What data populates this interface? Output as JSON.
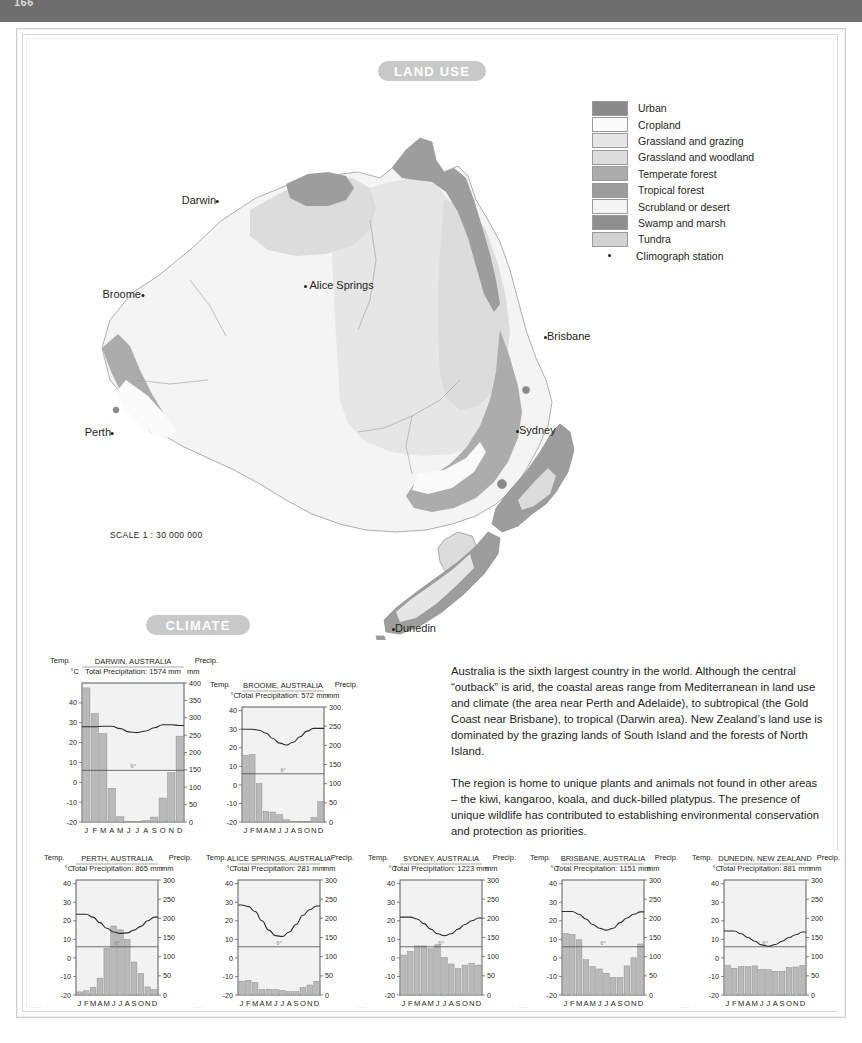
{
  "header": {
    "folio": "166"
  },
  "banners": {
    "land_use": "LAND USE",
    "climate": "CLIMATE"
  },
  "map": {
    "scale": "SCALE 1 : 30 000 000",
    "cities": [
      {
        "name": "Darwin",
        "x": 179,
        "y": 120,
        "align": "right"
      },
      {
        "name": "Broome",
        "x": 104,
        "y": 214,
        "align": "right"
      },
      {
        "name": "Alice Springs",
        "x": 308,
        "y": 276,
        "align": "left"
      },
      {
        "name": "Brisbane",
        "x": 551,
        "y": 325,
        "align": "left"
      },
      {
        "name": "Sydney",
        "x": 521,
        "y": 421,
        "align": "left"
      },
      {
        "name": "Perth",
        "x": 78,
        "y": 430,
        "align": "right"
      },
      {
        "name": "Dunedin",
        "x": 697,
        "y": 620,
        "align": "left"
      }
    ]
  },
  "legend": {
    "items": [
      {
        "label": "Urban",
        "color": "#8a8a8a"
      },
      {
        "label": "Cropland",
        "color": "#fbfbfb"
      },
      {
        "label": "Grassland and grazing",
        "color": "#e6e6e6"
      },
      {
        "label": "Grassland and woodland",
        "color": "#dcdcdc"
      },
      {
        "label": "Temperate forest",
        "color": "#acacac"
      },
      {
        "label": "Tropical forest",
        "color": "#9d9d9d"
      },
      {
        "label": "Scrubland or desert",
        "color": "#f4f4f4"
      },
      {
        "label": "Swamp and marsh",
        "color": "#8f8f8f"
      },
      {
        "label": "Tundra",
        "color": "#d2d2d2"
      }
    ],
    "station_label": "Climograph station"
  },
  "text": {
    "paragraph1": "Australia is the sixth largest country in the world. Although the central “outback” is arid, the coastal areas range from Mediterranean in land use and climate (the area near Perth and Adelaide), to subtropical (the Gold Coast near Brisbane), to tropical (Darwin area). New Zealand’s land use is dominated by the grazing lands of South Island and the forests of North Island.",
    "paragraph2": "The region is home to unique plants and animals not found in other areas – the kiwi, kangaroo, koala, and duck-billed platypus. The presence of unique wildlife has contributed to establishing environmental conservation and protection as priorities."
  },
  "chart_data": [
    {
      "id": "darwin",
      "type": "bar",
      "title": "DARWIN, AUSTRALIA",
      "subtitle": "Total Precipitation: 1574 mm",
      "temp_header": "Temp.",
      "precip_header": "Precip.",
      "temp_unit": "°C",
      "precip_unit": "mm",
      "categories": [
        "J",
        "F",
        "M",
        "A",
        "M",
        "J",
        "J",
        "A",
        "S",
        "O",
        "N",
        "D"
      ],
      "precip_values": [
        386,
        312,
        254,
        97,
        15,
        2,
        1,
        4,
        14,
        69,
        142,
        247
      ],
      "temp_values": [
        28,
        28,
        28.2,
        28.2,
        27,
        25.4,
        25,
        25.8,
        27.5,
        29,
        29,
        28.6
      ],
      "temp_ticks": [
        40,
        30,
        20,
        10,
        0,
        -10,
        -20
      ],
      "precip_ticks": [
        400,
        350,
        300,
        250,
        200,
        150,
        100,
        50,
        0
      ],
      "tlim": [
        -20,
        50
      ],
      "plim": [
        0,
        400
      ],
      "freeze_label": "6°"
    },
    {
      "id": "broome",
      "type": "bar",
      "title": "BROOME, AUSTRALIA",
      "subtitle": "Total Precipitation: 572 mm",
      "temp_header": "Temp.",
      "precip_header": "Precip.",
      "temp_unit": "°C",
      "precip_unit": "mm",
      "categories": [
        "J",
        "F",
        "M",
        "A",
        "M",
        "J",
        "J",
        "A",
        "S",
        "O",
        "N",
        "D"
      ],
      "precip_values": [
        174,
        176,
        100,
        28,
        26,
        19,
        6,
        2,
        1,
        1,
        12,
        53
      ],
      "temp_values": [
        30,
        30,
        29.5,
        28,
        25,
        22.5,
        21.5,
        23,
        26,
        29,
        30.5,
        30.5
      ],
      "temp_ticks": [
        40,
        30,
        20,
        10,
        0,
        -10,
        -20
      ],
      "precip_ticks": [
        300,
        250,
        200,
        150,
        100,
        50,
        0
      ],
      "tlim": [
        -20,
        42
      ],
      "plim": [
        0,
        300
      ],
      "freeze_label": "6°"
    },
    {
      "id": "perth",
      "type": "bar",
      "title": "PERTH, AUSTRALIA",
      "subtitle": "Total Precipitation: 865 mm",
      "temp_header": "Temp.",
      "precip_header": "Precip.",
      "temp_unit": "°C",
      "precip_unit": "mm",
      "categories": [
        "J",
        "F",
        "M",
        "A",
        "M",
        "J",
        "J",
        "A",
        "S",
        "O",
        "N",
        "D"
      ],
      "precip_values": [
        8,
        11,
        20,
        44,
        122,
        180,
        170,
        145,
        86,
        56,
        21,
        14
      ],
      "temp_values": [
        23.5,
        23.5,
        22,
        19,
        16,
        14,
        13.2,
        13.5,
        15,
        17,
        20,
        22
      ],
      "temp_ticks": [
        40,
        30,
        20,
        10,
        0,
        -10,
        -20
      ],
      "precip_ticks": [
        300,
        250,
        200,
        150,
        100,
        50,
        0
      ],
      "tlim": [
        -20,
        42
      ],
      "plim": [
        0,
        300
      ],
      "freeze_label": "6°"
    },
    {
      "id": "alice-springs",
      "type": "bar",
      "title": "ALICE SPRINGS, AUSTRALIA",
      "subtitle": "Total Precipitation: 281 mm",
      "temp_header": "Temp.",
      "precip_header": "Precip.",
      "temp_unit": "°C",
      "precip_unit": "mm",
      "categories": [
        "J",
        "F",
        "M",
        "A",
        "M",
        "J",
        "J",
        "A",
        "S",
        "O",
        "N",
        "D"
      ],
      "precip_values": [
        36,
        38,
        32,
        14,
        15,
        14,
        12,
        9,
        9,
        20,
        26,
        36
      ],
      "temp_values": [
        28.5,
        27.8,
        25,
        20,
        15,
        12,
        11.5,
        14,
        18,
        23,
        26,
        28
      ],
      "temp_ticks": [
        40,
        30,
        20,
        10,
        0,
        -10,
        -20
      ],
      "precip_ticks": [
        300,
        250,
        200,
        150,
        100,
        50,
        0
      ],
      "tlim": [
        -20,
        42
      ],
      "plim": [
        0,
        300
      ],
      "freeze_label": "6°"
    },
    {
      "id": "sydney",
      "type": "bar",
      "title": "SYDNEY, AUSTRALIA",
      "subtitle": "Total Precipitation: 1223 mm",
      "temp_header": "Temp.",
      "precip_header": "Precip.",
      "temp_unit": "°C",
      "precip_unit": "mm",
      "categories": [
        "J",
        "F",
        "M",
        "A",
        "M",
        "J",
        "J",
        "A",
        "S",
        "O",
        "N",
        "D"
      ],
      "precip_values": [
        104,
        114,
        128,
        128,
        121,
        131,
        98,
        81,
        69,
        78,
        83,
        78
      ],
      "temp_values": [
        22,
        22,
        21,
        18.5,
        15.5,
        13,
        12,
        13,
        15.5,
        18,
        20,
        21.5
      ],
      "temp_ticks": [
        40,
        30,
        20,
        10,
        0,
        -10,
        -20
      ],
      "precip_ticks": [
        300,
        250,
        200,
        150,
        100,
        50,
        0
      ],
      "tlim": [
        -20,
        42
      ],
      "plim": [
        0,
        300
      ],
      "freeze_label": "6°"
    },
    {
      "id": "brisbane",
      "type": "bar",
      "title": "BRISBANE, AUSTRALIA",
      "subtitle": "Total Precipitation: 1151 mm",
      "temp_header": "Temp.",
      "precip_header": "Precip.",
      "temp_unit": "°C",
      "precip_unit": "mm",
      "categories": [
        "J",
        "F",
        "M",
        "A",
        "M",
        "J",
        "J",
        "A",
        "S",
        "O",
        "N",
        "D"
      ],
      "precip_values": [
        160,
        158,
        144,
        92,
        74,
        68,
        57,
        46,
        46,
        76,
        97,
        133
      ],
      "temp_values": [
        25,
        25,
        23.5,
        21,
        18,
        16,
        15,
        16,
        19,
        21.5,
        23.5,
        24.8
      ],
      "temp_ticks": [
        40,
        30,
        20,
        10,
        0,
        -10,
        -20
      ],
      "precip_ticks": [
        300,
        250,
        200,
        150,
        100,
        50,
        0
      ],
      "tlim": [
        -20,
        42
      ],
      "plim": [
        0,
        300
      ],
      "freeze_label": "6°"
    },
    {
      "id": "dunedin",
      "type": "bar",
      "title": "DUNEDIN, NEW ZEALAND",
      "subtitle": "Total Precipitation: 881 mm",
      "temp_header": "Temp.",
      "precip_header": "Precip.",
      "temp_unit": "°C",
      "precip_unit": "mm",
      "categories": [
        "J",
        "F",
        "M",
        "A",
        "M",
        "J",
        "J",
        "A",
        "S",
        "O",
        "N",
        "D"
      ],
      "precip_values": [
        77,
        70,
        74,
        74,
        76,
        67,
        66,
        62,
        62,
        72,
        73,
        77
      ],
      "temp_values": [
        14.5,
        14.5,
        13,
        11,
        9,
        7,
        6.3,
        7.2,
        9,
        11,
        12.5,
        14
      ],
      "temp_ticks": [
        40,
        30,
        20,
        10,
        0,
        -10,
        -20
      ],
      "precip_ticks": [
        300,
        250,
        200,
        150,
        100,
        50,
        0
      ],
      "tlim": [
        -20,
        42
      ],
      "plim": [
        0,
        300
      ],
      "freeze_label": "6°"
    }
  ]
}
